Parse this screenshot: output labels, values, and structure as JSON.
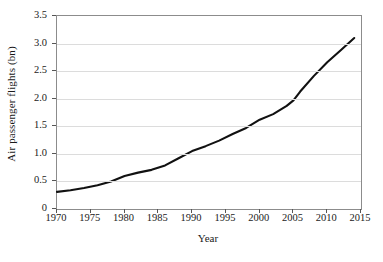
{
  "chart_data": {
    "type": "line",
    "title": "",
    "xlabel": "Year",
    "ylabel": "Air passenger flights (bn)",
    "xlim": [
      1970,
      2015
    ],
    "ylim": [
      0,
      3.5
    ],
    "xticks": [
      1970,
      1975,
      1980,
      1985,
      1990,
      1995,
      2000,
      2005,
      2010,
      2015
    ],
    "xtick_labels": [
      "1970",
      "1975",
      "1980",
      "1985",
      "1990",
      "1995",
      "2000",
      "2005",
      "2010",
      "2015"
    ],
    "yticks": [
      0,
      0.5,
      1.0,
      1.5,
      2.0,
      2.5,
      3.0,
      3.5
    ],
    "ytick_labels": [
      "0",
      "0.5",
      "1.0",
      "1.5",
      "2.0",
      "2.5",
      "3.0",
      "3.5"
    ],
    "grid": "horizontal",
    "legend": "none",
    "line_color": "#111111",
    "grid_color": "#dcdcdc",
    "frame_color": "#8c8c8c",
    "series": [
      {
        "name": "Air passenger flights",
        "x": [
          1970,
          1972,
          1974,
          1976,
          1978,
          1980,
          1982,
          1984,
          1986,
          1988,
          1990,
          1992,
          1994,
          1996,
          1998,
          2000,
          2002,
          2004,
          2005,
          2006,
          2008,
          2010,
          2012,
          2014
        ],
        "values": [
          0.31,
          0.34,
          0.38,
          0.43,
          0.5,
          0.6,
          0.66,
          0.71,
          0.79,
          0.92,
          1.05,
          1.14,
          1.24,
          1.36,
          1.47,
          1.62,
          1.72,
          1.87,
          1.97,
          2.13,
          2.41,
          2.66,
          2.88,
          3.1
        ]
      }
    ]
  },
  "axes": {
    "y_title": "Air passenger flights (bn)",
    "x_title": "Year"
  }
}
